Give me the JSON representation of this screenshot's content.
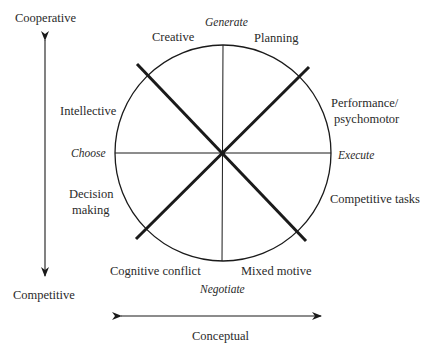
{
  "diagram": {
    "type": "circumplex",
    "vertical_axis": {
      "top_label": "Cooperative",
      "bottom_label": "Competitive"
    },
    "horizontal_axis": {
      "label": "Conceptual"
    },
    "process_labels": {
      "top": "Generate",
      "left": "Choose",
      "right": "Execute",
      "bottom": "Negotiate"
    },
    "task_types": {
      "creative": "Creative",
      "planning": "Planning",
      "intellective": "Intellective",
      "performance_line1": "Performance/",
      "performance_line2": "psychomotor",
      "decision_line1": "Decision",
      "decision_line2": "making",
      "competitive": "Competitive tasks",
      "cognitive": "Cognitive conflict",
      "mixed": "Mixed motive"
    },
    "colors": {
      "line": "#1a1a1a",
      "text": "#2a2a2a",
      "background": "#ffffff"
    }
  }
}
